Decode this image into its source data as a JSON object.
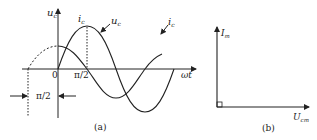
{
  "figure_a": {
    "caption": "(a)",
    "y_axis_label": "u",
    "y_axis_sub": "c",
    "x_axis_label": "ωt",
    "origin_label": "0",
    "tick_label": "π/2",
    "phase_label": "π/2",
    "curves": [
      {
        "name": "u",
        "sub": "c",
        "label_text": "u_c",
        "description": "capacitor voltage, sine starting at 0"
      },
      {
        "name": "i",
        "sub": "c",
        "label_text": "i_c",
        "description": "capacitor current, leads voltage by π/2"
      }
    ],
    "peak_label": "i",
    "peak_label_sub": "c"
  },
  "figure_b": {
    "caption": "(b)",
    "vertical_phasor": "I",
    "vertical_phasor_sub": "m",
    "horizontal_phasor": "U",
    "horizontal_phasor_sub": "cm"
  },
  "colors": {
    "line": "#222222",
    "background": "#ffffff"
  }
}
